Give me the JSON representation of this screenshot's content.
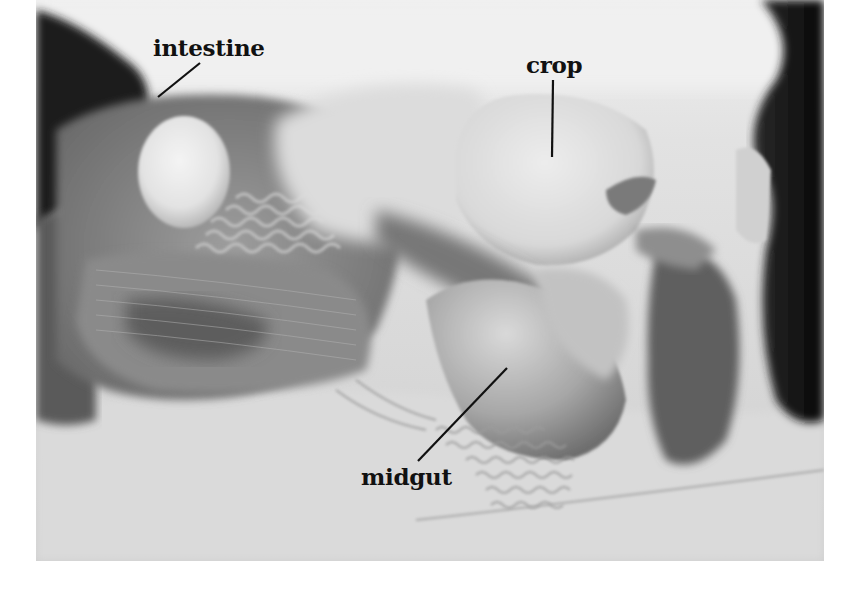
{
  "figure": {
    "type": "labeled anatomical photograph",
    "colors": {
      "page_background": "#ffffff",
      "label_text": "#111111",
      "leader_line": "#111111"
    },
    "labels": [
      {
        "id": "intestine",
        "text": "intestine",
        "text_box": {
          "x": 153,
          "y": 36,
          "font_size": 23
        },
        "leader": {
          "x1": 200,
          "y1": 63,
          "x2": 158,
          "y2": 97
        }
      },
      {
        "id": "crop",
        "text": "crop",
        "text_box": {
          "x": 526,
          "y": 53,
          "font_size": 23
        },
        "leader": {
          "x1": 553,
          "y1": 80,
          "x2": 552,
          "y2": 157
        }
      },
      {
        "id": "midgut",
        "text": "midgut",
        "text_box": {
          "x": 361,
          "y": 465,
          "font_size": 23
        },
        "leader": {
          "x1": 507,
          "y1": 368,
          "x2": 418,
          "y2": 461
        }
      }
    ]
  }
}
